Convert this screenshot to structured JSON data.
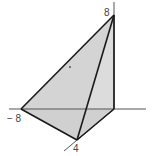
{
  "diagram": {
    "type": "3d-tetrahedron-plot",
    "colors": {
      "face_fill": "#d9d9d9",
      "edge": "#1a1a1a",
      "axis": "#555555",
      "background": "#ffffff"
    },
    "labels": {
      "z_intercept": "8",
      "x_intercept": "− 8",
      "y_intercept": "4"
    },
    "vertices": {
      "top": [
        114,
        15
      ],
      "origin": [
        114,
        109
      ],
      "left": [
        21,
        109
      ],
      "bottom": [
        77,
        140
      ]
    }
  }
}
